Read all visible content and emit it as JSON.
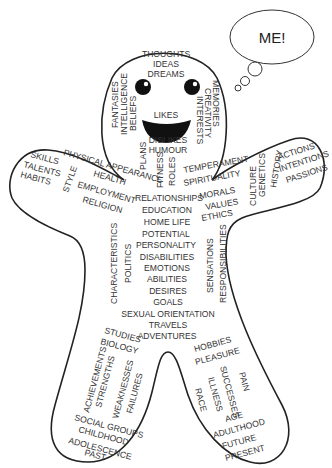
{
  "thought_bubble": {
    "text": "ME!"
  },
  "head": {
    "top": [
      "THOUGHTS",
      "IDEAS",
      "DREAMS"
    ],
    "left_vertical": [
      "FANTASIES",
      "INTELLIGENCE",
      "BELIEFS"
    ],
    "right_vertical": [
      "MEMORIES",
      "CREATIVITY",
      "INTERESTS"
    ],
    "mouth": "LIKES",
    "below_mouth": [
      "DISLIKES",
      "HUMOUR"
    ]
  },
  "neck": {
    "left_vertical": "PLANS",
    "fitness": "FITNESS",
    "roles": "ROLES"
  },
  "left_arm": {
    "hand": [
      "SKILLS",
      "TALENTS",
      "HABITS"
    ],
    "style": "STYLE",
    "arm": [
      "PHYSICAL APPEARANCE",
      "HEALTH",
      "EMPLOYMENT",
      "RELIGION"
    ]
  },
  "right_arm": {
    "arm": [
      "TEMPERAMENT",
      "SPIRITUALITY",
      "MORALS",
      "VALUES",
      "ETHICS"
    ],
    "vertical": [
      "CULTURE",
      "GENETICS",
      "HISTORY"
    ],
    "hand": [
      "ACTIONS",
      "INTENTIONS",
      "PASSIONS"
    ]
  },
  "torso": {
    "center": [
      "RELATIONSHIPS",
      "EDUCATION",
      "HOME LIFE",
      "POTENTIAL",
      "PERSONALITY",
      "DISABILITIES",
      "EMOTIONS",
      "ABILITIES",
      "DESIRES",
      "GOALS",
      "SEXUAL ORIENTATION",
      "TRAVELS",
      "ADVENTURES"
    ],
    "left_vertical": [
      "CHARACTERISTICS",
      "POLITICS"
    ],
    "right_vertical": [
      "SENSATIONS",
      "RESPONSIBILITIES"
    ]
  },
  "left_leg": {
    "top": [
      "STUDIES",
      "BIOLOGY"
    ],
    "vertical": [
      "ACHIEVEMENTS",
      "STRENGTHS",
      "WEAKNESSES",
      "FAILURES"
    ],
    "bottom": [
      "SOCIAL GROUPS",
      "CHILDHOOD",
      "ADOLESCENCE",
      "PAST"
    ]
  },
  "right_leg": {
    "top": [
      "HOBBIES",
      "PLEASURE"
    ],
    "vertical": [
      "RACE",
      "ILLNESS",
      "SUCCESSES",
      "PAIN"
    ],
    "bottom": [
      "AGE",
      "ADULTHOOD",
      "FUTURE",
      "PRESENT"
    ]
  }
}
